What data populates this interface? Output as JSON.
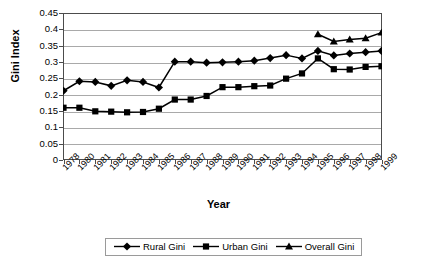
{
  "chart_data": {
    "type": "line",
    "title": "",
    "xlabel": "Year",
    "ylabel": "Gini Index",
    "ylim": [
      0,
      0.45
    ],
    "ytick_values": [
      0.45,
      0.4,
      0.35,
      0.3,
      0.25,
      0.2,
      0.15,
      0.1,
      0.05,
      0
    ],
    "ytick_labels": [
      "0.45",
      "0.4",
      "0.35",
      "0.3",
      "0.25",
      "0.2",
      "0.15",
      "0.1",
      "0.05",
      "0"
    ],
    "grid": true,
    "legend_position": "bottom",
    "categories": [
      "1978",
      "1980",
      "1981",
      "1982",
      "1983",
      "1984",
      "1985",
      "1986",
      "1987",
      "1988",
      "1989",
      "1990",
      "1991",
      "1992",
      "1993",
      "1994",
      "1995",
      "1996",
      "1997",
      "1998",
      "1999"
    ],
    "series": [
      {
        "name": "Rural Gini",
        "marker": "diamond",
        "color": "#000000",
        "values": [
          0.212,
          0.241,
          0.239,
          0.227,
          0.244,
          0.239,
          0.222,
          0.301,
          0.301,
          0.298,
          0.299,
          0.301,
          0.304,
          0.312,
          0.321,
          0.311,
          0.334,
          0.32,
          0.326,
          0.33,
          0.334
        ]
      },
      {
        "name": "Urban Gini",
        "marker": "square",
        "color": "#000000",
        "values": [
          0.16,
          0.16,
          0.149,
          0.148,
          0.146,
          0.147,
          0.157,
          0.185,
          0.185,
          0.196,
          0.223,
          0.223,
          0.226,
          0.228,
          0.249,
          0.265,
          0.311,
          0.278,
          0.277,
          0.285,
          0.287
        ]
      },
      {
        "name": "Overall Gini",
        "marker": "triangle",
        "color": "#000000",
        "values": [
          null,
          null,
          null,
          null,
          null,
          null,
          null,
          null,
          null,
          null,
          null,
          null,
          null,
          null,
          null,
          null,
          0.385,
          0.363,
          0.369,
          0.373,
          0.39
        ]
      }
    ]
  },
  "legend": {
    "items": [
      {
        "label": "Rural Gini",
        "marker": "diamond"
      },
      {
        "label": "Urban Gini",
        "marker": "square"
      },
      {
        "label": "Overall Gini",
        "marker": "triangle"
      }
    ]
  }
}
